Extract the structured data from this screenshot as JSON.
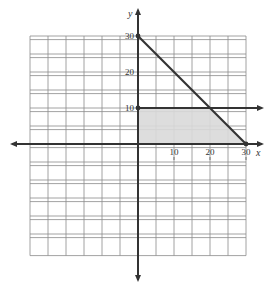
{
  "chart_data": {
    "type": "line",
    "title": "",
    "xlabel": "x",
    "ylabel": "y",
    "xlim": [
      -30,
      30
    ],
    "ylim": [
      -30,
      30
    ],
    "grid": true,
    "grid_step": 5,
    "x_ticks": [
      10,
      20,
      30
    ],
    "y_ticks": [
      10,
      20,
      30
    ],
    "x_tick_labels": [
      "10",
      "20",
      "30"
    ],
    "y_tick_labels": [
      "10",
      "20",
      "30"
    ],
    "series": [
      {
        "name": "x + y = 30",
        "points": [
          [
            0,
            30
          ],
          [
            30,
            0
          ]
        ],
        "style": "segment with endpoints"
      },
      {
        "name": "y = 10",
        "points": [
          [
            0,
            10
          ],
          [
            35,
            10
          ]
        ],
        "style": "ray with arrow"
      }
    ],
    "shaded_region": {
      "description": "feasible region x>=0, 0<=y<=10, x+y<=30",
      "vertices": [
        [
          0,
          0
        ],
        [
          0,
          10
        ],
        [
          20,
          10
        ],
        [
          30,
          0
        ]
      ],
      "color": "#d9d9d9"
    },
    "points": [
      [
        0,
        30
      ],
      [
        0,
        10
      ],
      [
        30,
        0
      ]
    ]
  },
  "colors": {
    "grid": "#8a8a8a",
    "axis": "#333333",
    "line": "#333333",
    "shade": "#d9d9d9"
  }
}
